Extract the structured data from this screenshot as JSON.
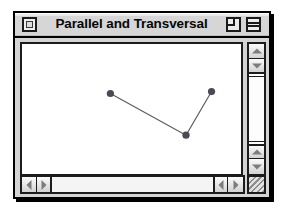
{
  "window": {
    "title": "Parallel and Transversal",
    "close_label": "",
    "zoom_label": "",
    "shade_label": "",
    "grow_label": ""
  },
  "icons": {
    "close": "close-box-icon",
    "zoom": "zoom-box-icon",
    "shade": "windowshade-box-icon",
    "grow": "grow-box-icon",
    "scroll_up": "triangle-up-icon",
    "scroll_down": "triangle-down-icon",
    "scroll_left": "triangle-left-icon",
    "scroll_right": "triangle-right-icon"
  },
  "colors": {
    "window_frame": "#000000",
    "titlebar": "#d6d6d6",
    "canvas": "#ffffff",
    "chrome": "#d4d4d4",
    "line": "#5a5a64",
    "marker": "#4a4a55",
    "arrow": "#7d7d7d"
  },
  "scrollbars": {
    "vertical": {
      "up_top_label": "",
      "down_top_label": "",
      "up_bottom_label": "",
      "down_bottom_label": ""
    },
    "horizontal": {
      "left_start_label": "",
      "right_start_label": "",
      "left_end_label": "",
      "right_end_label": ""
    }
  },
  "chart_data": {
    "type": "line",
    "title": "",
    "xlabel": "",
    "ylabel": "",
    "grid": false,
    "legend": false,
    "xlim": [
      0,
      223
    ],
    "ylim": [
      0,
      134
    ],
    "marker": "circle",
    "marker_size": 5,
    "x": [
      90,
      167,
      193
    ],
    "y": [
      51,
      94,
      49
    ],
    "points": [
      {
        "x": 90,
        "y": 51
      },
      {
        "x": 167,
        "y": 94
      },
      {
        "x": 193,
        "y": 49
      }
    ],
    "series": [
      {
        "name": "transversal",
        "x": [
          90,
          167,
          193
        ],
        "y": [
          51,
          94,
          49
        ]
      }
    ],
    "annotations": []
  }
}
